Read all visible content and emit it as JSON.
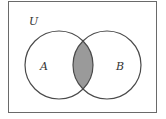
{
  "diagram": {
    "type": "venn",
    "universe_label": "U",
    "sets": [
      {
        "label": "A"
      },
      {
        "label": "B"
      }
    ],
    "shaded_region": "A ∩ B",
    "colors": {
      "stroke": "#4a4a4a",
      "shade": "#9a9a9a",
      "frame": "#6a6a6a",
      "background": "#ffffff"
    }
  }
}
